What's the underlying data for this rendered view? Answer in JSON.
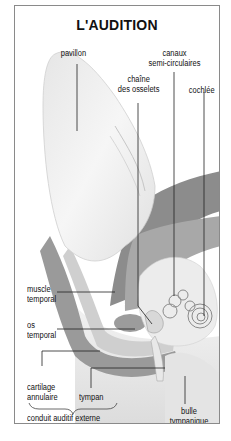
{
  "title": "L'AUDITION",
  "labels": {
    "pavillon": "pavillon",
    "canaux_line1": "canaux",
    "canaux_line2": "semi-circulaires",
    "chaine_line1": "chaîne",
    "chaine_line2": "des osselets",
    "cochlee": "cochlée",
    "muscle_line1": "muscle",
    "muscle_line2": "temporal",
    "os_line1": "os",
    "os_line2": "temporal",
    "cartilage_line1": "cartilage",
    "cartilage_line2": "annulaire",
    "tympan": "tympan",
    "conduit": "conduit auditif externe",
    "bulle_line1": "bulle",
    "bulle_line2": "tympanique"
  },
  "colors": {
    "frame": "#8a8a8a",
    "dark_tissue": "#8c8c8c",
    "mid_tissue": "#b4b4b4",
    "light_tissue": "#e2e2e2",
    "leader_lines": "#222222"
  }
}
